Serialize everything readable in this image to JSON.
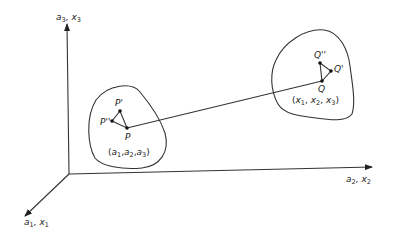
{
  "diagram": {
    "axes": {
      "vertical": {
        "label": "a",
        "sub": "3",
        "label2": "x",
        "sub2": "3"
      },
      "horizontal": {
        "label": "a",
        "sub": "2",
        "label2": "x",
        "sub2": "2"
      },
      "diagonal": {
        "label": "a",
        "sub": "1",
        "label2": "x",
        "sub2": "1"
      }
    },
    "left_region": {
      "coords_label": "(a1,a2,a3)",
      "coords": [
        {
          "t": "a",
          "s": "1"
        },
        {
          "t": "a",
          "s": "2"
        },
        {
          "t": "a",
          "s": "3"
        }
      ],
      "points": {
        "P": "P",
        "P_prime": "P'",
        "P_double_prime": "P''"
      }
    },
    "right_region": {
      "coords_label": "(x1,x2,x3)",
      "coords": [
        {
          "t": "x",
          "s": "1"
        },
        {
          "t": "x",
          "s": "2"
        },
        {
          "t": "x",
          "s": "3"
        }
      ],
      "points": {
        "Q": "Q",
        "Q_prime": "Q'",
        "Q_double_prime": "Q''"
      }
    },
    "connector": "line from P to Q"
  }
}
